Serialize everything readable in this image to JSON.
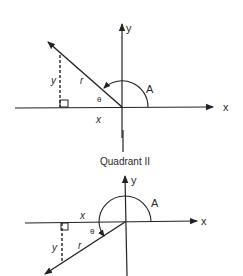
{
  "figure": {
    "caption": "Quadrant II",
    "colors": {
      "ink": "#222222",
      "background": "#ffffff"
    },
    "top_diagram": {
      "axis_x_label": "x",
      "axis_y_label": "y",
      "angle_label": "A",
      "ref_angle_label": "θ",
      "radius_label": "r",
      "leg_x_label": "x",
      "leg_y_label": "y"
    },
    "bottom_diagram": {
      "axis_x_label": "x",
      "axis_y_label": "y",
      "angle_label": "A",
      "ref_angle_label": "θ",
      "radius_label": "r",
      "leg_x_label": "x",
      "leg_y_label": "y"
    }
  }
}
